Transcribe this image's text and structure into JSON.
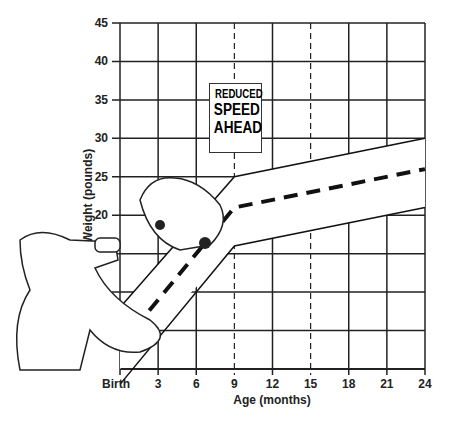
{
  "chart_data": {
    "type": "line",
    "title": "",
    "xlabel": "Age (months)",
    "ylabel": "Weight (pounds)",
    "x_ticks": [
      "Birth",
      "3",
      "6",
      "9",
      "12",
      "15",
      "18",
      "21",
      "24"
    ],
    "y_ticks": [
      "5",
      "10",
      "15",
      "20",
      "25",
      "30",
      "35",
      "40",
      "45"
    ],
    "ylim": [
      0,
      45
    ],
    "xlim": [
      0,
      24
    ],
    "grid": true,
    "dashed_vertical_lines": [
      9,
      15
    ],
    "series": [
      {
        "name": "upper band",
        "x": [
          0,
          9,
          24
        ],
        "y": [
          8,
          25,
          30
        ]
      },
      {
        "name": "median (dashed)",
        "x": [
          0,
          9,
          24
        ],
        "y": [
          3,
          21,
          26
        ]
      },
      {
        "name": "lower band",
        "x": [
          0,
          9,
          24
        ],
        "y": [
          -2,
          16,
          21
        ]
      }
    ],
    "annotations": [
      "REDUCED SPEED AHEAD"
    ]
  },
  "sign": {
    "line1": "REDUCED",
    "line2": "SPEED",
    "line3": "AHEAD"
  },
  "axes": {
    "xlabel": "Age (months)",
    "ylabel": "Weight (pounds)"
  }
}
